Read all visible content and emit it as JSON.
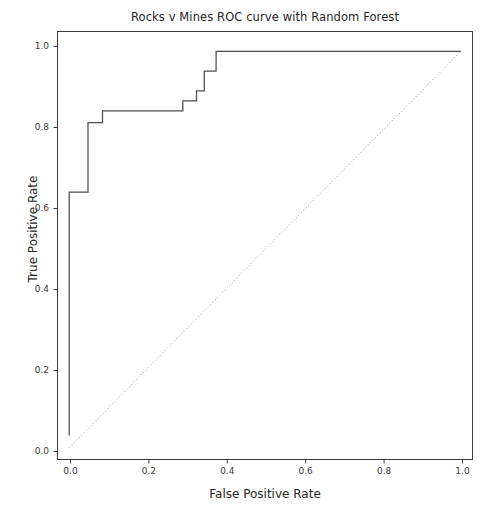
{
  "chart_data": {
    "type": "line",
    "title": "Rocks v Mines ROC curve with Random Forest",
    "xlabel": "False Positive Rate",
    "ylabel": "True Positive Rate",
    "xlim": [
      -0.03,
      1.03
    ],
    "ylim": [
      -0.03,
      1.05
    ],
    "grid": false,
    "legend": null,
    "xticks": [
      0.0,
      0.2,
      0.4,
      0.6,
      0.8,
      1.0
    ],
    "xtick_labels": [
      "0.0",
      "0.2",
      "0.4",
      "0.6",
      "0.8",
      "1.0"
    ],
    "yticks": [
      0.0,
      0.2,
      0.4,
      0.6,
      0.8,
      1.0
    ],
    "ytick_labels": [
      "0.0",
      "0.2",
      "0.4",
      "0.6",
      "0.8",
      "1.0"
    ],
    "series": [
      {
        "name": "ROC curve",
        "style": "solid",
        "color": "#4d4d4d",
        "drawstyle": "steps-post",
        "x": [
          0.0,
          0.0,
          0.012,
          0.012,
          0.048,
          0.048,
          0.085,
          0.085,
          0.29,
          0.29,
          0.305,
          0.305,
          0.325,
          0.325,
          0.345,
          0.345,
          0.375,
          0.375,
          1.0
        ],
        "y": [
          0.03,
          0.645,
          0.645,
          0.645,
          0.645,
          0.82,
          0.82,
          0.85,
          0.85,
          0.875,
          0.875,
          0.875,
          0.9,
          0.9,
          0.95,
          0.95,
          1.0,
          1.0,
          1.0
        ]
      },
      {
        "name": "chance diagonal",
        "style": "dotted",
        "color": "#9a9a9a",
        "drawstyle": "default",
        "x": [
          0.0,
          1.0
        ],
        "y": [
          0.0,
          1.0
        ]
      }
    ]
  },
  "figure": {
    "background_color": "#ffffff",
    "axes_edge_color": "#3c3c3c",
    "text_color": "#262626"
  }
}
